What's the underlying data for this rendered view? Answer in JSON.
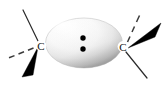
{
  "figure": {
    "type": "chemical-structure-diagram",
    "background_color": "#ffffff",
    "width": 165,
    "height": 86
  },
  "atoms": [
    {
      "id": "left-carbon",
      "label": "C",
      "x": 41,
      "y": 46
    },
    {
      "id": "right-carbon",
      "label": "C",
      "x": 123,
      "y": 47
    }
  ],
  "orbital": {
    "name": "central-orbital-lobe",
    "shape": "ellipsoid",
    "cx": 84,
    "cy": 43,
    "rx": 38,
    "ry": 25,
    "fill_light": "#ffffff",
    "fill_shade": "#9a9a9a",
    "edge_color": "#b5b5b5"
  },
  "lone_pair": {
    "name": "lone-pair-electrons",
    "count": 2,
    "dot_color": "#000000",
    "dots": [
      {
        "cx": 83,
        "cy": 38,
        "r": 2.6
      },
      {
        "cx": 83,
        "cy": 49,
        "r": 2.6
      }
    ]
  },
  "bonds": [
    {
      "id": "left-plain-bond-up",
      "style": "plain-line",
      "color": "#2b2b2b",
      "from": [
        23,
        10
      ],
      "to": [
        38,
        41
      ]
    },
    {
      "id": "left-dashed-bond",
      "style": "hashed-wedge",
      "color": "#3a3a3a",
      "from": [
        36,
        47
      ],
      "to": [
        8,
        58
      ]
    },
    {
      "id": "left-solid-wedge",
      "style": "solid-wedge",
      "color": "#000000",
      "apex": [
        38,
        48
      ],
      "base_a": [
        22,
        77
      ],
      "base_b": [
        33,
        74
      ]
    },
    {
      "id": "right-dashed-bond",
      "style": "hashed-wedge",
      "color": "#3a3a3a",
      "from": [
        127,
        43
      ],
      "to": [
        140,
        13
      ]
    },
    {
      "id": "right-solid-wedge",
      "style": "solid-wedge",
      "color": "#000000",
      "apex": [
        128,
        47
      ],
      "base_a": [
        160,
        24
      ],
      "base_b": [
        155,
        35
      ]
    },
    {
      "id": "right-plain-bond-down",
      "style": "plain-line",
      "color": "#2b2b2b",
      "from": [
        126,
        52
      ],
      "to": [
        147,
        78
      ]
    }
  ]
}
